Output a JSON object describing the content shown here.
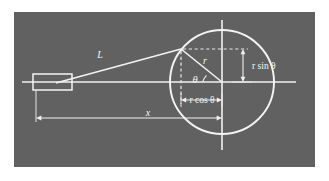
{
  "figure": {
    "kind": "geometry-diagram",
    "background_color": "#636363",
    "ink_color": "#f4f4f4",
    "page_color": "#ffffff"
  },
  "labels": {
    "rod_length": "L",
    "crank_radius": "r",
    "angle": "θ",
    "vertical_projection": "r sin θ",
    "horizontal_projection": "r cos θ",
    "displacement": "x"
  },
  "geometry": {
    "panel": {
      "x": 14,
      "y": 12,
      "width": 301,
      "height": 155
    },
    "circle": {
      "cx": 222,
      "cy": 82,
      "r": 52
    },
    "crank_pin": {
      "x": 181,
      "y": 49
    },
    "piston_pin": {
      "x": 58,
      "y": 82
    },
    "piston_rect": {
      "x": 33,
      "y": 74,
      "width": 39,
      "height": 16
    },
    "axis_horizontal": {
      "x1": 22,
      "y1": 82,
      "x2": 296,
      "y2": 82
    },
    "axis_vertical": {
      "x1": 222,
      "y1": 20,
      "x2": 222,
      "y2": 150
    },
    "dim_rsin": {
      "x": 243,
      "y_top": 49,
      "y_bottom": 82
    },
    "dim_rcos": {
      "y": 100,
      "x_left": 181,
      "x_right": 222
    },
    "dim_x": {
      "y": 118,
      "x_left": 36,
      "x_right": 222
    }
  },
  "label_positions": {
    "rod_length": {
      "x": 100,
      "y": 58
    },
    "crank_radius": {
      "x": 205,
      "y": 63
    },
    "angle": {
      "x": 196,
      "y": 82
    },
    "vertical_projection": {
      "x": 252,
      "y": 69
    },
    "horizontal_projection": {
      "x": 202,
      "y": 104
    },
    "displacement": {
      "x": 148,
      "y": 116
    }
  }
}
